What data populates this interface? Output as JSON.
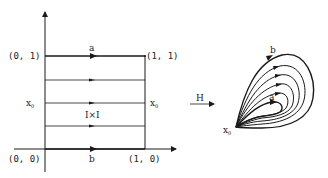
{
  "left_figure": {
    "name": "unit-square-homotopy-domain",
    "corner_labels": {
      "top_left": "(0, 1)",
      "top_right": "(1, 1)",
      "bottom_left": "(0, 0)",
      "bottom_right": "(1, 0)"
    },
    "top_edge_label": "a",
    "bottom_edge_label": "b",
    "left_mid_label": "x",
    "right_mid_label": "x",
    "basepoint_subscript": "0",
    "center_label": "I×I",
    "horizontal_lines": 5
  },
  "map": {
    "label": "H"
  },
  "right_figure": {
    "name": "loops-at-basepoint",
    "outer_loop_label": "b",
    "inner_loop_label": "a",
    "basepoint_label": "x",
    "basepoint_subscript": "0",
    "loop_count": 6
  },
  "colors": {
    "stroke": "#1a1a1a",
    "text": "#222222",
    "background": "#ffffff"
  }
}
